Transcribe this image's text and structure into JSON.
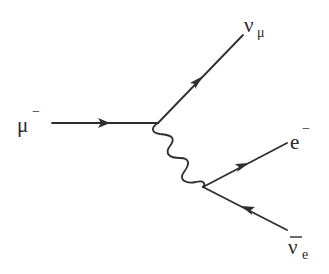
{
  "diagram": {
    "type": "feynman",
    "particles": {
      "incoming_muon": {
        "symbol": "μ",
        "superscript": "−"
      },
      "muon_neutrino": {
        "symbol": "ν",
        "subscript": "μ"
      },
      "electron": {
        "symbol": "e",
        "superscript": "−"
      },
      "electron_antineutrino": {
        "symbol": "ν",
        "subscript": "e",
        "overline": true
      }
    },
    "propagator": {
      "type": "wavy",
      "boson": "W⁻"
    },
    "colors": {
      "line": "#2e2e2e",
      "text": "#2a2a2a",
      "background": "#ffffff"
    }
  }
}
